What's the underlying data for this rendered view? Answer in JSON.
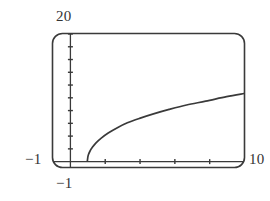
{
  "figure": {
    "name": "graphing-calculator-plot",
    "background_color": "#ffffff",
    "ink_color": "#3a3a3a"
  },
  "labels": {
    "y_max": "20",
    "y_min": "−1",
    "x_min": "−1",
    "x_max": "10"
  },
  "chart_data": {
    "type": "line",
    "title": "",
    "xlabel": "",
    "ylabel": "",
    "xlim": [
      -1,
      10
    ],
    "ylim": [
      -1,
      20
    ],
    "grid": false,
    "legend": null,
    "frame": {
      "style": "rounded-rectangle",
      "corner_radius": 10,
      "color": "#3a3a3a",
      "line_width": 1.6
    },
    "axes": {
      "x_axis_at_y": 0,
      "y_axis_at_x": 0,
      "x_tick_count": 4,
      "y_tick_count": 10,
      "x_tick_values": [
        2,
        4,
        6,
        8
      ],
      "y_tick_values": [
        2,
        4,
        6,
        8,
        10,
        12,
        14,
        16,
        18,
        20
      ],
      "tick_length": 5
    },
    "series": [
      {
        "name": "sqrt-curve",
        "color": "#3a3a3a",
        "line_width": 1.7,
        "x": [
          1.0,
          1.05,
          1.15,
          1.3,
          1.5,
          1.8,
          2.2,
          2.7,
          3.3,
          4.0,
          4.8,
          5.7,
          6.7,
          7.8,
          9.0,
          10.0
        ],
        "y": [
          0.0,
          0.9,
          1.55,
          2.2,
          2.85,
          3.6,
          4.4,
          5.2,
          6.0,
          6.7,
          7.4,
          8.1,
          8.8,
          9.4,
          10.1,
          10.6
        ]
      }
    ]
  }
}
